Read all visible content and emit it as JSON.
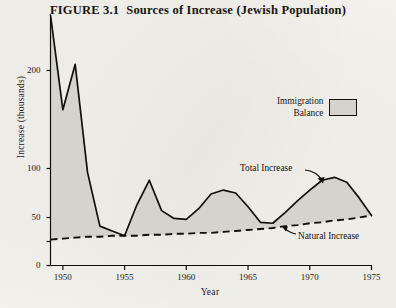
{
  "figure": {
    "number": "FIGURE 3.1",
    "title": "Sources of Increase (Jewish Population)"
  },
  "legend": {
    "line1": "Immigration",
    "line2": "Balance",
    "swatch_color": "#d4d3cd",
    "swatch_border": "#11100c"
  },
  "annotations": {
    "total": "Total Increase",
    "natural": "Natural Increase"
  },
  "axes": {
    "x_label": "Year",
    "y_label": "Increase (thousands)",
    "x_ticks": [
      "1950",
      "1955",
      "1960",
      "1965",
      "1970",
      "1975"
    ],
    "y_ticks": [
      "200",
      "100",
      "50",
      "0"
    ]
  },
  "chart_data": {
    "type": "area",
    "title": "Sources of Increase (Jewish Population)",
    "xlabel": "Year",
    "ylabel": "Increase (thousands)",
    "xlim": [
      1949,
      1975
    ],
    "ylim": [
      0,
      240
    ],
    "y_tick_values": [
      200,
      100,
      50,
      25,
      0
    ],
    "y_tick_labels": [
      "200",
      "100",
      "50",
      "",
      "0"
    ],
    "y_axis_scale": "nonlinear-compressed",
    "x_tick_values": [
      1950,
      1955,
      1960,
      1965,
      1970,
      1975
    ],
    "grid": false,
    "legend_position": "upper-right",
    "legend_entries": [
      "Immigration Balance"
    ],
    "annotations": [
      {
        "text": "Total Increase",
        "points_to": "upper solid curve"
      },
      {
        "text": "Natural Increase",
        "points_to": "lower dashed curve"
      }
    ],
    "series": [
      {
        "name": "Total Increase",
        "style": "solid",
        "x": [
          1949,
          1950,
          1951,
          1952,
          1953,
          1954,
          1955,
          1956,
          1957,
          1958,
          1959,
          1960,
          1961,
          1962,
          1963,
          1964,
          1965,
          1966,
          1967,
          1968,
          1969,
          1970,
          1971,
          1972,
          1973,
          1974,
          1975
        ],
        "values": [
          245,
          160,
          205,
          96,
          41,
          36,
          31,
          63,
          88,
          57,
          49,
          48,
          59,
          74,
          78,
          75,
          61,
          45,
          44,
          55,
          67,
          78,
          88,
          91,
          86,
          70,
          52
        ]
      },
      {
        "name": "Natural Increase",
        "style": "dashed",
        "x": [
          1949,
          1950,
          1951,
          1952,
          1953,
          1954,
          1955,
          1956,
          1957,
          1958,
          1959,
          1960,
          1961,
          1962,
          1963,
          1964,
          1965,
          1966,
          1967,
          1968,
          1969,
          1970,
          1971,
          1972,
          1973,
          1974,
          1975
        ],
        "values": [
          27,
          28,
          29,
          30,
          30,
          31,
          31,
          31,
          32,
          32,
          33,
          33,
          34,
          34,
          35,
          36,
          37,
          38,
          39,
          41,
          42,
          44,
          45,
          47,
          48,
          50,
          52
        ]
      }
    ],
    "filled_band": {
      "name": "Immigration Balance",
      "between": [
        "Natural Increase",
        "Total Increase"
      ],
      "fill_color": "#d4d3cd"
    }
  }
}
